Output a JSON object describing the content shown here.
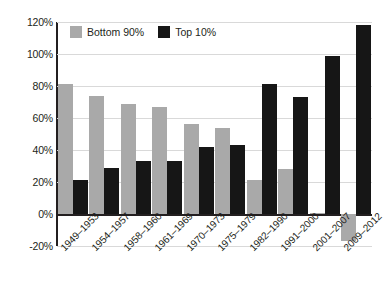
{
  "chart_data": {
    "type": "bar",
    "title": "",
    "subtitle": "",
    "xlabel": "",
    "ylabel": "",
    "ylim": [
      -20,
      120
    ],
    "ytick_values": [
      120,
      100,
      80,
      60,
      40,
      20,
      0,
      -20
    ],
    "ytick_labels": [
      "120%",
      "100%",
      "80%",
      "60%",
      "40%",
      "20%",
      "0%",
      "-20%"
    ],
    "grid": true,
    "legend_position": "top-left-inside",
    "categories": [
      "1949–1953",
      "1954–1957",
      "1958–1960",
      "1961–1969",
      "1970–1973",
      "1975–1979",
      "1982–1990",
      "1991–2000",
      "2001–2007",
      "2009–2012"
    ],
    "series": [
      {
        "name": "Bottom 90%",
        "color": "#a9a9a9",
        "values": [
          81,
          74,
          69,
          67,
          56,
          54,
          21,
          28,
          0.5,
          -17
        ]
      },
      {
        "name": "Top 10%",
        "color": "#161616",
        "values": [
          21,
          29,
          33,
          33,
          42,
          43,
          81,
          73,
          99,
          118
        ]
      }
    ]
  },
  "legend": {
    "items": [
      {
        "label": "Bottom 90%",
        "swatch_name": "legend-swatch-bottom-90",
        "color": "#a9a9a9"
      },
      {
        "label": "Top 10%",
        "swatch_name": "legend-swatch-top-10",
        "color": "#161616"
      }
    ]
  }
}
